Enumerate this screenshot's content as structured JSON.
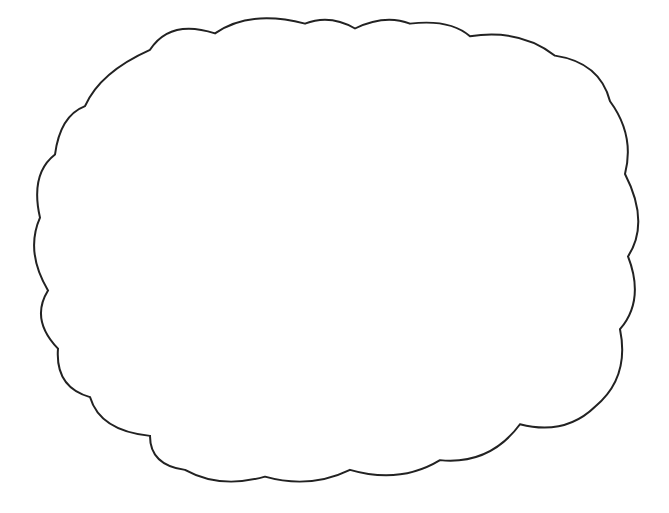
{
  "worksheet": {
    "problem": "32 × 2l",
    "line1": {
      "prefix": "32 × 20 is",
      "suffix": "."
    },
    "line2": {
      "hint": "32 more",
      "middle": "is",
      "suffix": "."
    }
  }
}
